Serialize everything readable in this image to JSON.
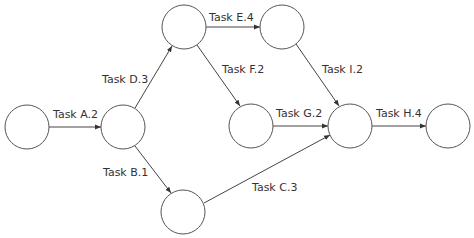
{
  "diagram": {
    "type": "activity-on-arrow network",
    "nodes": [
      {
        "id": "n1",
        "cx": 27,
        "cy": 127
      },
      {
        "id": "n2",
        "cx": 123,
        "cy": 127
      },
      {
        "id": "n3",
        "cx": 184,
        "cy": 27
      },
      {
        "id": "n4",
        "cx": 282,
        "cy": 27
      },
      {
        "id": "n5",
        "cx": 251,
        "cy": 126
      },
      {
        "id": "n6",
        "cx": 350,
        "cy": 126
      },
      {
        "id": "n7",
        "cx": 448,
        "cy": 126
      },
      {
        "id": "n8",
        "cx": 183,
        "cy": 212
      }
    ],
    "node_radius": 22,
    "edges": [
      {
        "from": "n1",
        "to": "n2",
        "label": "Task A.2"
      },
      {
        "from": "n2",
        "to": "n3",
        "label": "Task D.3"
      },
      {
        "from": "n2",
        "to": "n8",
        "label": "Task B.1"
      },
      {
        "from": "n3",
        "to": "n4",
        "label": "Task E.4"
      },
      {
        "from": "n3",
        "to": "n5",
        "label": "Task F.2"
      },
      {
        "from": "n4",
        "to": "n6",
        "label": "Task I.2"
      },
      {
        "from": "n5",
        "to": "n6",
        "label": "Task G.2"
      },
      {
        "from": "n8",
        "to": "n6",
        "label": "Task C.3"
      },
      {
        "from": "n6",
        "to": "n7",
        "label": "Task H.4"
      }
    ]
  },
  "labels": {
    "a": "Task A.2",
    "b": "Task B.1",
    "c": "Task C.3",
    "d": "Task D.3",
    "e": "Task E.4",
    "f": "Task F.2",
    "g": "Task G.2",
    "h": "Task H.4",
    "i": "Task I.2"
  }
}
